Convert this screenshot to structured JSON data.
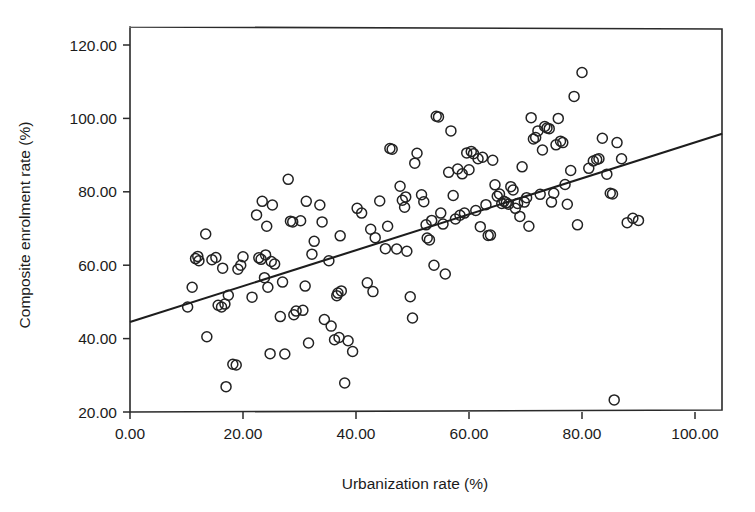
{
  "chart_data": {
    "type": "scatter",
    "title": "",
    "xlabel": "Urbanization rate (%)",
    "ylabel": "Composite enrolment rate (%)",
    "xlim": [
      0,
      104.8
    ],
    "ylim": [
      20,
      124
    ],
    "xticks": [
      0,
      20,
      40,
      60,
      80,
      100
    ],
    "xtick_labels": [
      "0.00",
      "20.00",
      "40.00",
      "60.00",
      "80.00",
      "100.00"
    ],
    "yticks": [
      20,
      40,
      60,
      80,
      100,
      120
    ],
    "ytick_labels": [
      "20.00",
      "40.00",
      "60.00",
      "80.00",
      "100.00",
      "120.00"
    ],
    "grid": false,
    "legend": "none",
    "marker": "open-circle",
    "marker_radius_px": 5,
    "trendline": {
      "type": "linear-fit",
      "x_start": 0,
      "y_start": 44.5,
      "x_end": 104.8,
      "y_end": 95.8,
      "slope": 0.49,
      "intercept": 44.5
    },
    "points": [
      [
        10.2,
        48.6
      ],
      [
        11.0,
        54.0
      ],
      [
        11.6,
        61.8
      ],
      [
        12.0,
        62.4
      ],
      [
        12.2,
        61.2
      ],
      [
        13.4,
        68.5
      ],
      [
        13.6,
        40.5
      ],
      [
        14.5,
        61.5
      ],
      [
        15.2,
        62.1
      ],
      [
        15.6,
        49.1
      ],
      [
        16.2,
        48.6
      ],
      [
        16.4,
        59.2
      ],
      [
        16.8,
        49.4
      ],
      [
        17.0,
        26.9
      ],
      [
        17.4,
        51.8
      ],
      [
        18.2,
        33.0
      ],
      [
        18.8,
        32.8
      ],
      [
        19.1,
        58.9
      ],
      [
        19.6,
        60.0
      ],
      [
        20.0,
        62.3
      ],
      [
        21.6,
        51.3
      ],
      [
        22.4,
        73.7
      ],
      [
        22.8,
        62.0
      ],
      [
        23.2,
        61.6
      ],
      [
        23.4,
        77.4
      ],
      [
        23.8,
        56.6
      ],
      [
        24.0,
        62.8
      ],
      [
        24.2,
        70.6
      ],
      [
        24.4,
        54.0
      ],
      [
        24.8,
        35.9
      ],
      [
        25.0,
        61.0
      ],
      [
        25.2,
        76.4
      ],
      [
        25.6,
        60.3
      ],
      [
        26.6,
        46.0
      ],
      [
        27.0,
        55.4
      ],
      [
        27.4,
        35.8
      ],
      [
        28.0,
        83.4
      ],
      [
        28.4,
        72.0
      ],
      [
        28.8,
        71.8
      ],
      [
        29.0,
        46.5
      ],
      [
        29.4,
        47.5
      ],
      [
        30.2,
        72.1
      ],
      [
        30.6,
        47.7
      ],
      [
        31.0,
        54.3
      ],
      [
        31.2,
        77.4
      ],
      [
        31.6,
        38.8
      ],
      [
        32.2,
        63.0
      ],
      [
        32.6,
        66.5
      ],
      [
        33.6,
        76.4
      ],
      [
        34.0,
        71.8
      ],
      [
        34.4,
        45.2
      ],
      [
        35.2,
        61.2
      ],
      [
        35.6,
        43.4
      ],
      [
        36.2,
        39.7
      ],
      [
        36.6,
        51.7
      ],
      [
        36.8,
        52.4
      ],
      [
        37.0,
        40.3
      ],
      [
        37.2,
        68.0
      ],
      [
        37.4,
        53.0
      ],
      [
        38.0,
        27.9
      ],
      [
        38.6,
        39.4
      ],
      [
        39.4,
        36.5
      ],
      [
        40.2,
        75.5
      ],
      [
        41.0,
        74.2
      ],
      [
        42.0,
        55.2
      ],
      [
        42.6,
        69.8
      ],
      [
        43.0,
        52.8
      ],
      [
        43.4,
        67.5
      ],
      [
        44.2,
        77.5
      ],
      [
        45.2,
        64.5
      ],
      [
        45.6,
        70.6
      ],
      [
        46.0,
        91.8
      ],
      [
        46.4,
        91.6
      ],
      [
        47.2,
        64.4
      ],
      [
        47.8,
        81.5
      ],
      [
        48.2,
        77.7
      ],
      [
        48.6,
        75.8
      ],
      [
        48.8,
        78.6
      ],
      [
        49.0,
        63.8
      ],
      [
        49.6,
        51.4
      ],
      [
        50.0,
        45.6
      ],
      [
        50.4,
        87.8
      ],
      [
        50.8,
        90.5
      ],
      [
        51.6,
        79.2
      ],
      [
        52.0,
        77.3
      ],
      [
        52.4,
        71.0
      ],
      [
        52.6,
        67.4
      ],
      [
        53.0,
        66.9
      ],
      [
        53.4,
        72.2
      ],
      [
        53.8,
        60.0
      ],
      [
        54.2,
        100.6
      ],
      [
        54.6,
        100.4
      ],
      [
        55.0,
        74.2
      ],
      [
        55.4,
        71.2
      ],
      [
        55.8,
        57.6
      ],
      [
        56.4,
        85.3
      ],
      [
        56.8,
        96.6
      ],
      [
        57.2,
        79.0
      ],
      [
        57.6,
        72.6
      ],
      [
        58.0,
        86.2
      ],
      [
        58.4,
        73.6
      ],
      [
        58.8,
        84.9
      ],
      [
        59.2,
        74.2
      ],
      [
        59.6,
        90.6
      ],
      [
        60.0,
        86.0
      ],
      [
        60.4,
        91.0
      ],
      [
        60.8,
        90.4
      ],
      [
        61.2,
        74.9
      ],
      [
        61.6,
        89.0
      ],
      [
        62.0,
        70.5
      ],
      [
        62.4,
        89.4
      ],
      [
        63.0,
        76.5
      ],
      [
        63.4,
        68.1
      ],
      [
        63.8,
        68.2
      ],
      [
        64.2,
        88.6
      ],
      [
        64.6,
        81.9
      ],
      [
        65.0,
        78.8
      ],
      [
        65.4,
        79.4
      ],
      [
        65.8,
        76.8
      ],
      [
        66.2,
        77.4
      ],
      [
        66.6,
        77.0
      ],
      [
        67.0,
        76.6
      ],
      [
        67.4,
        81.4
      ],
      [
        67.8,
        80.5
      ],
      [
        68.2,
        75.5
      ],
      [
        68.6,
        76.8
      ],
      [
        69.0,
        73.3
      ],
      [
        69.4,
        86.8
      ],
      [
        69.8,
        77.2
      ],
      [
        70.2,
        78.4
      ],
      [
        70.6,
        70.6
      ],
      [
        71.0,
        100.2
      ],
      [
        71.4,
        94.4
      ],
      [
        71.8,
        94.8
      ],
      [
        72.2,
        96.6
      ],
      [
        72.6,
        79.3
      ],
      [
        73.0,
        91.4
      ],
      [
        73.4,
        97.8
      ],
      [
        73.8,
        97.4
      ],
      [
        74.2,
        97.2
      ],
      [
        74.6,
        77.2
      ],
      [
        75.0,
        79.6
      ],
      [
        75.4,
        92.8
      ],
      [
        75.8,
        100.0
      ],
      [
        76.2,
        93.8
      ],
      [
        76.6,
        93.4
      ],
      [
        77.0,
        82.0
      ],
      [
        77.4,
        76.6
      ],
      [
        78.0,
        85.8
      ],
      [
        78.6,
        106.0
      ],
      [
        79.2,
        71.0
      ],
      [
        80.0,
        112.5
      ],
      [
        81.2,
        86.4
      ],
      [
        82.0,
        88.4
      ],
      [
        82.6,
        88.8
      ],
      [
        83.0,
        89.0
      ],
      [
        83.6,
        94.6
      ],
      [
        84.4,
        84.8
      ],
      [
        85.0,
        79.6
      ],
      [
        85.4,
        79.4
      ],
      [
        85.7,
        23.3
      ],
      [
        86.2,
        93.4
      ],
      [
        87.0,
        89.0
      ],
      [
        88.0,
        71.6
      ],
      [
        89.0,
        72.8
      ],
      [
        90.0,
        72.2
      ]
    ]
  },
  "axes": {
    "x_axis_name": "x-axis",
    "y_axis_name": "y-axis"
  }
}
